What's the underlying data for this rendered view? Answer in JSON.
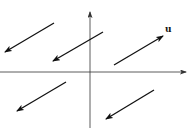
{
  "diagram": {
    "type": "vector-field-parallel-translates",
    "colors": {
      "background": "#ffffff",
      "axis": "#333333",
      "vector": "#111111"
    },
    "axes": {
      "x_axis": {
        "from": [
          0,
          72
        ],
        "to": [
          186,
          72
        ]
      },
      "y_axis": {
        "from": [
          90,
          128
        ],
        "to": [
          90,
          12
        ]
      }
    },
    "vectors": [
      {
        "id": "top-left",
        "from": [
          54,
          23
        ],
        "to": [
          5,
          52
        ],
        "label": ""
      },
      {
        "id": "top-middle",
        "from": [
          103,
          32
        ],
        "to": [
          53,
          61
        ],
        "label": ""
      },
      {
        "id": "u",
        "from": [
          114,
          65
        ],
        "to": [
          163,
          36
        ],
        "label": "u"
      },
      {
        "id": "bottom-left",
        "from": [
          66,
          82
        ],
        "to": [
          17,
          111
        ],
        "label": ""
      },
      {
        "id": "bottom-right",
        "from": [
          154,
          90
        ],
        "to": [
          106,
          119
        ],
        "label": ""
      }
    ],
    "labels": {
      "u_label": "u"
    }
  }
}
